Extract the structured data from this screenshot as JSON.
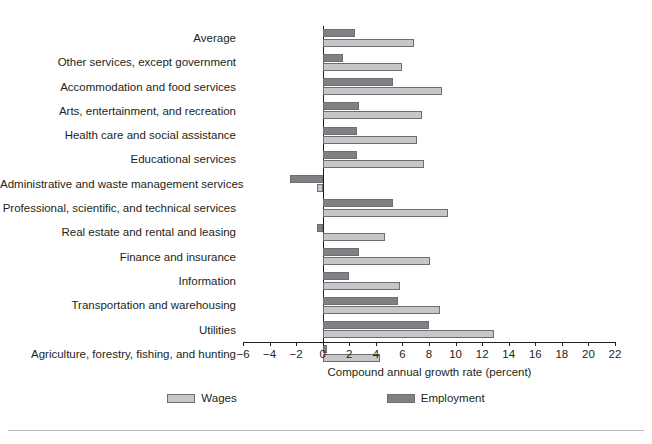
{
  "chart_data": {
    "type": "bar",
    "orientation": "horizontal",
    "title": "",
    "xlabel": "Compound annual growth rate (percent)",
    "ylabel": "",
    "xlim": [
      -6,
      22
    ],
    "xticks": [
      -6,
      -4,
      -2,
      0,
      2,
      4,
      6,
      8,
      10,
      12,
      14,
      16,
      18,
      20,
      22
    ],
    "xtick_labels": [
      "−6",
      "−4",
      "−2",
      "0",
      "2",
      "4",
      "6",
      "8",
      "10",
      "12",
      "14",
      "16",
      "18",
      "20",
      "22"
    ],
    "grid": false,
    "legend_position": "bottom",
    "categories": [
      "Average",
      "Other services, except government",
      "Accommodation and food services",
      "Arts, entertainment, and recreation",
      "Health care and social assistance",
      "Educational services",
      "Administrative and waste management services",
      "Professional, scientific, and technical services",
      "Real estate and rental and leasing",
      "Finance and insurance",
      "Information",
      "Transportation and warehousing",
      "Utilities",
      "Agriculture, forestry, fishing, and hunting"
    ],
    "series": [
      {
        "name": "Wages",
        "color": "#c6c7c9",
        "values": [
          6.9,
          6.0,
          9.0,
          7.5,
          7.1,
          7.6,
          -0.4,
          9.4,
          4.7,
          8.1,
          5.8,
          8.8,
          12.9,
          4.3
        ]
      },
      {
        "name": "Employment",
        "color": "#808184",
        "values": [
          2.4,
          1.5,
          5.3,
          2.7,
          2.6,
          2.6,
          -2.5,
          5.3,
          -0.4,
          2.7,
          2.0,
          5.7,
          8.0,
          0.3
        ]
      }
    ]
  },
  "legend": {
    "items": [
      {
        "label": "Wages",
        "swatch": "wages-swatch"
      },
      {
        "label": "Employment",
        "swatch": "employment-swatch"
      }
    ]
  }
}
